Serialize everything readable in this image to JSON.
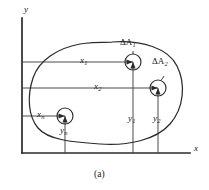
{
  "figure": {
    "caption": "(a)",
    "axes": {
      "y_label": "y",
      "x_label": "x",
      "y_axis": {
        "x": 22,
        "y_top": 18,
        "y_bottom": 153
      },
      "x_axis": {
        "y": 153,
        "x_left": 22,
        "x_right": 190
      }
    },
    "region": {
      "name": "area-blob",
      "description": "closed irregular planar region A"
    },
    "elements": [
      {
        "id": "element-1",
        "area_label": "ΔA",
        "area_sub": "1",
        "x_label": "x",
        "x_sub": "1",
        "y_label": "y",
        "y_sub": "1",
        "cx": 133,
        "cy": 62,
        "r": 8
      },
      {
        "id": "element-2",
        "area_label": "ΔA",
        "area_sub": "2",
        "x_label": "x",
        "x_sub": "2",
        "y_label": "y",
        "y_sub": "2",
        "cx": 158,
        "cy": 88,
        "r": 8
      },
      {
        "id": "element-n",
        "area_label": "",
        "area_sub": "",
        "x_label": "x",
        "x_sub": "n",
        "y_label": "y",
        "y_sub": "n",
        "cx": 65,
        "cy": 116,
        "r": 8
      }
    ],
    "labels": {
      "delta_a1": "ΔA",
      "delta_a1_sub": "1",
      "delta_a2": "ΔA",
      "delta_a2_sub": "2",
      "x1": "x",
      "x1_sub": "1",
      "x2": "x",
      "x2_sub": "2",
      "xn": "x",
      "xn_sub": "n",
      "y1": "y",
      "y1_sub": "1",
      "y2": "y",
      "y2_sub": "2",
      "yn": "y",
      "yn_sub": "n"
    },
    "colors": {
      "ink": "#1a1a1a",
      "line": "#3a3a3a",
      "background": "#ffffff"
    }
  }
}
